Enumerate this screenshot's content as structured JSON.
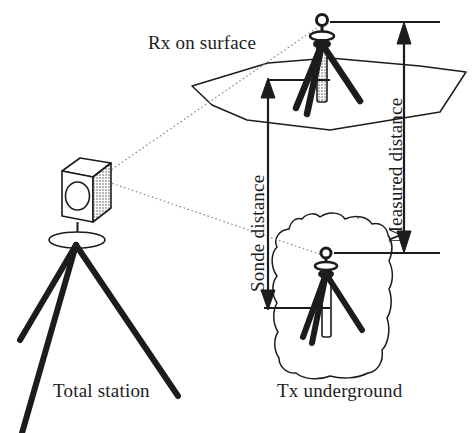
{
  "figure": {
    "background_color": "#ffffff",
    "ink_color": "#1c1c1c",
    "sight_line_color": "#8a8a8a"
  },
  "labels": {
    "rx_on_surface": "Rx on surface",
    "total_station": "Total station",
    "tx_underground": "Tx underground",
    "sonde_distance": "Sonde distance",
    "measured_distance": "Measured distance"
  },
  "elements": {
    "total_station_instrument": "total-station-box",
    "total_station_tripod": "total-station-tripod",
    "rx_tripod": "rx-tripod",
    "tx_tripod": "tx-tripod",
    "ground_surface": "ground-surface-plane",
    "rock_mass": "underground-rock-mass",
    "sight_line_upper": "sight-line-to-rx",
    "sight_line_lower": "sight-line-to-tx",
    "sonde_arrow": "sonde-distance-dimension-arrow",
    "measured_arrow": "measured-distance-dimension-arrow"
  },
  "dimensions": {
    "sonde_distance_arrow": {
      "orientation": "vertical",
      "double_headed": true,
      "top_y": 85,
      "bottom_y": 302,
      "x": 268
    },
    "measured_distance_arrow": {
      "orientation": "vertical",
      "double_headed": true,
      "top_y": 27,
      "bottom_y": 248,
      "x": 404
    }
  }
}
